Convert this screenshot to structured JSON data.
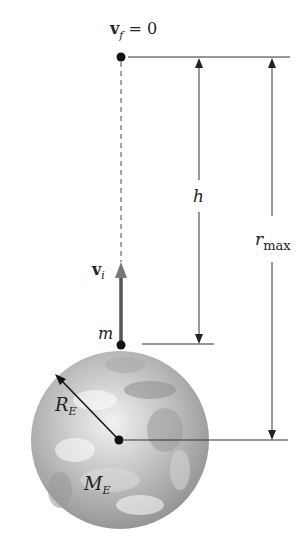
{
  "diagram": {
    "labels": {
      "vf_main": "v",
      "vf_sub": "f",
      "vf_eq": " = 0",
      "vi_main": "v",
      "vi_sub": "i",
      "m": "m",
      "h": "h",
      "rmax_main": "r",
      "rmax_sub": "max",
      "re_main": "R",
      "re_sub": "E",
      "me_main": "M",
      "me_sub": "E"
    },
    "colors": {
      "line": "#333333",
      "dashed": "#888888",
      "arrow_vi": "#6b6b6b",
      "earth_light": "#e6e6e6",
      "earth_mid": "#b4b4b4",
      "earth_dark": "#8a8a8a"
    }
  }
}
